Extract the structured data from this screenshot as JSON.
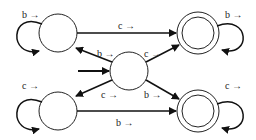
{
  "diagram": {
    "type": "finite-state-automaton",
    "states": [
      {
        "id": "center",
        "cx": 129,
        "cy": 71,
        "r": 19,
        "accepting": false,
        "initial": true
      },
      {
        "id": "top_left",
        "cx": 58,
        "cy": 33,
        "r": 19,
        "accepting": false,
        "initial": false
      },
      {
        "id": "bottom_left",
        "cx": 58,
        "cy": 111,
        "r": 19,
        "accepting": false,
        "initial": false
      },
      {
        "id": "top_right",
        "cx": 198,
        "cy": 33,
        "r": 21,
        "accepting": true,
        "initial": false
      },
      {
        "id": "bottom_right",
        "cx": 198,
        "cy": 111,
        "r": 21,
        "accepting": true,
        "initial": false
      }
    ],
    "transitions": [
      {
        "from": "top_left",
        "to": "top_left",
        "label": "b →"
      },
      {
        "from": "top_left",
        "to": "top_right",
        "label": "c →"
      },
      {
        "from": "top_right",
        "to": "top_right",
        "label": "b →"
      },
      {
        "from": "center",
        "to": "top_left",
        "label": "b →"
      },
      {
        "from": "center",
        "to": "top_right",
        "label": "c →"
      },
      {
        "from": "center",
        "to": "bottom_left",
        "label": "c →"
      },
      {
        "from": "center",
        "to": "bottom_right",
        "label": "b →"
      },
      {
        "from": "bottom_left",
        "to": "bottom_left",
        "label": "c →"
      },
      {
        "from": "bottom_left",
        "to": "bottom_right",
        "label": "b →"
      },
      {
        "from": "bottom_right",
        "to": "bottom_right",
        "label": "c →"
      }
    ]
  },
  "labels": {
    "tl_loop": "b →",
    "tl_to_tr": "c →",
    "tr_loop": "b →",
    "center_to_tl": "b →",
    "center_to_tr": "c →",
    "center_to_bl": "c →",
    "center_to_br": "b →",
    "bl_loop": "c →",
    "bl_to_br": "b →",
    "br_loop": "c →"
  }
}
